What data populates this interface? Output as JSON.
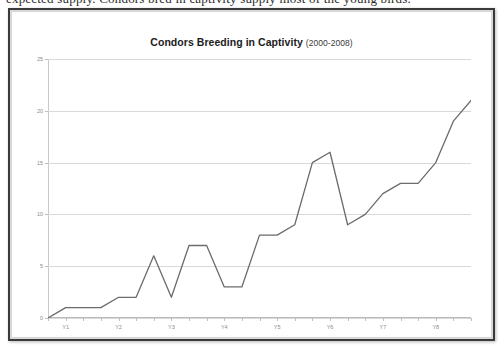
{
  "top_text_sliver": "expected supply. Condors bred in captivity supply most of the young birds.",
  "chart_title": "Condors Breeding in Captivity",
  "chart_subtitle": "(2000-2008)",
  "chart_data": {
    "type": "line",
    "title": "Condors Breeding in Captivity",
    "subtitle": "(2000-2008)",
    "xlabel": "",
    "ylabel": "",
    "ylim": [
      0,
      25
    ],
    "y_ticks": [
      0,
      5,
      10,
      15,
      20,
      25
    ],
    "y_tick_labels": [
      "0",
      "5",
      "10",
      "15",
      "20",
      "25"
    ],
    "x_tick_labels": [
      "Y1",
      "Y2",
      "Y3",
      "Y4",
      "Y5",
      "Y6",
      "Y7",
      "Y8"
    ],
    "x_tick_indices": [
      1,
      4,
      7,
      10,
      13,
      16,
      19,
      22
    ],
    "grid": true,
    "legend": "none",
    "line_color": "#6b6b6b",
    "series": [
      {
        "name": "Condors bred in captivity",
        "x": [
          0,
          1,
          2,
          3,
          4,
          5,
          6,
          7,
          8,
          9,
          10,
          11,
          12,
          13,
          14,
          15,
          16,
          17,
          18,
          19,
          20,
          21,
          22,
          23,
          24
        ],
        "values": [
          0,
          1,
          1,
          1,
          2,
          2,
          6,
          2,
          7,
          7,
          3,
          3,
          8,
          8,
          9,
          15,
          16,
          9,
          10,
          12,
          13,
          13,
          15,
          19,
          21
        ]
      }
    ]
  }
}
